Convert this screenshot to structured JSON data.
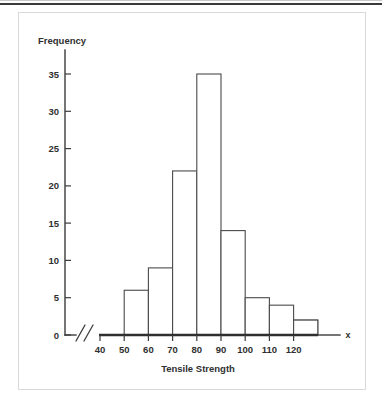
{
  "figure": {
    "y_axis_label": "Frequency",
    "x_axis_label": "Tensile Strength",
    "x_variable_symbol": "x",
    "axis_break_symbol": "//",
    "frame_color": "#d9d9d9",
    "axis_color": "#3b3b3b",
    "bar_fill_color": "#ffffff",
    "bar_stroke_color": "#4a4a4a"
  },
  "chart_data": {
    "type": "bar",
    "title": "",
    "subtitle": "",
    "xlabel": "Tensile Strength",
    "ylabel": "Frequency",
    "categories": [
      "40-50",
      "50-60",
      "60-70",
      "70-80",
      "80-90",
      "90-100",
      "100-110",
      "110-120",
      "120-130"
    ],
    "bin_edges": [
      40,
      50,
      60,
      70,
      80,
      90,
      100,
      110,
      120,
      130
    ],
    "values": [
      3,
      6,
      9,
      22,
      35,
      14,
      5,
      4,
      2
    ],
    "x_tick_labels": [
      "40",
      "50",
      "60",
      "70",
      "80",
      "90",
      "100",
      "110",
      "120"
    ],
    "x_tick_values": [
      40,
      50,
      60,
      70,
      80,
      90,
      100,
      110,
      120
    ],
    "y_tick_labels": [
      "0",
      "5",
      "10",
      "15",
      "20",
      "25",
      "30",
      "35"
    ],
    "y_tick_values": [
      0,
      5,
      10,
      15,
      20,
      25,
      30,
      35
    ],
    "ylim": [
      0,
      37
    ],
    "xlim": [
      40,
      130
    ],
    "grid": false,
    "legend": false,
    "axis_break": true
  }
}
